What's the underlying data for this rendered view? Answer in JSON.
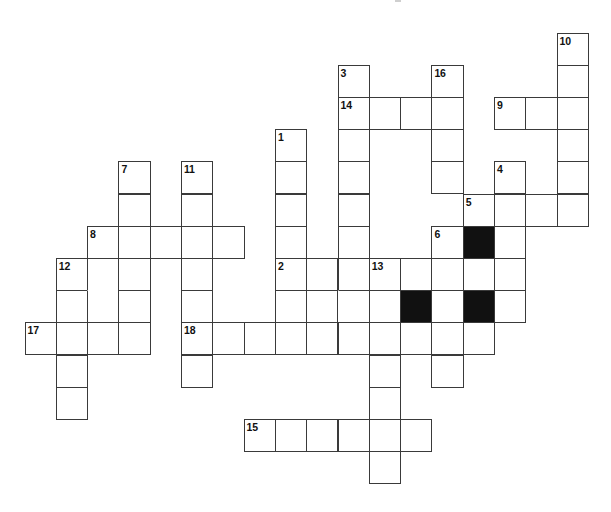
{
  "puzzle": {
    "type": "crossword",
    "grid": {
      "origin_x": 24.5,
      "origin_y": 32.5,
      "cell_width": 31.3,
      "cell_height": 32.2,
      "columns": 18,
      "rows": 14
    },
    "colors": {
      "background": "#ffffff",
      "cell_fill": "#ffffff",
      "block_fill": "#111111",
      "line": "#3a3a3a",
      "number": "#111111"
    },
    "cells": [
      {
        "c": 17,
        "r": 0,
        "num": "10"
      },
      {
        "c": 10,
        "r": 1,
        "num": "3"
      },
      {
        "c": 13,
        "r": 1,
        "num": "16"
      },
      {
        "c": 17,
        "r": 1
      },
      {
        "c": 10,
        "r": 2,
        "num": "14"
      },
      {
        "c": 11,
        "r": 2
      },
      {
        "c": 12,
        "r": 2
      },
      {
        "c": 13,
        "r": 2
      },
      {
        "c": 15,
        "r": 2,
        "num": "9"
      },
      {
        "c": 16,
        "r": 2
      },
      {
        "c": 17,
        "r": 2
      },
      {
        "c": 8,
        "r": 3,
        "num": "1"
      },
      {
        "c": 10,
        "r": 3
      },
      {
        "c": 13,
        "r": 3
      },
      {
        "c": 17,
        "r": 3
      },
      {
        "c": 3,
        "r": 4,
        "num": "7"
      },
      {
        "c": 5,
        "r": 4,
        "num": "11"
      },
      {
        "c": 8,
        "r": 4
      },
      {
        "c": 10,
        "r": 4
      },
      {
        "c": 13,
        "r": 4
      },
      {
        "c": 15,
        "r": 4,
        "num": "4"
      },
      {
        "c": 17,
        "r": 4
      },
      {
        "c": 3,
        "r": 5
      },
      {
        "c": 5,
        "r": 5
      },
      {
        "c": 8,
        "r": 5
      },
      {
        "c": 10,
        "r": 5
      },
      {
        "c": 14,
        "r": 5,
        "num": "5"
      },
      {
        "c": 15,
        "r": 5
      },
      {
        "c": 16,
        "r": 5
      },
      {
        "c": 17,
        "r": 5
      },
      {
        "c": 2,
        "r": 6,
        "num": "8"
      },
      {
        "c": 3,
        "r": 6
      },
      {
        "c": 4,
        "r": 6
      },
      {
        "c": 5,
        "r": 6
      },
      {
        "c": 6,
        "r": 6
      },
      {
        "c": 8,
        "r": 6
      },
      {
        "c": 10,
        "r": 6
      },
      {
        "c": 13,
        "r": 6,
        "num": "6"
      },
      {
        "c": 14,
        "r": 6,
        "black": true
      },
      {
        "c": 15,
        "r": 6
      },
      {
        "c": 1,
        "r": 7,
        "num": "12"
      },
      {
        "c": 2,
        "r": 7
      },
      {
        "c": 3,
        "r": 7
      },
      {
        "c": 5,
        "r": 7
      },
      {
        "c": 8,
        "r": 7,
        "num": "2"
      },
      {
        "c": 9,
        "r": 7
      },
      {
        "c": 10,
        "r": 7
      },
      {
        "c": 11,
        "r": 7,
        "num": "13"
      },
      {
        "c": 12,
        "r": 7
      },
      {
        "c": 13,
        "r": 7
      },
      {
        "c": 14,
        "r": 7
      },
      {
        "c": 15,
        "r": 7
      },
      {
        "c": 1,
        "r": 8
      },
      {
        "c": 2,
        "r": 8,
        "noTop": true
      },
      {
        "c": 3,
        "r": 8
      },
      {
        "c": 5,
        "r": 8
      },
      {
        "c": 8,
        "r": 8
      },
      {
        "c": 9,
        "r": 8
      },
      {
        "c": 10,
        "r": 8,
        "noLeft": true
      },
      {
        "c": 11,
        "r": 8
      },
      {
        "c": 12,
        "r": 8,
        "black": true
      },
      {
        "c": 13,
        "r": 8
      },
      {
        "c": 14,
        "r": 8,
        "black": true
      },
      {
        "c": 15,
        "r": 8
      },
      {
        "c": 0,
        "r": 9,
        "num": "17"
      },
      {
        "c": 1,
        "r": 9
      },
      {
        "c": 2,
        "r": 9
      },
      {
        "c": 3,
        "r": 9
      },
      {
        "c": 5,
        "r": 9,
        "num": "18"
      },
      {
        "c": 6,
        "r": 9
      },
      {
        "c": 7,
        "r": 9
      },
      {
        "c": 8,
        "r": 9
      },
      {
        "c": 9,
        "r": 9
      },
      {
        "c": 10,
        "r": 9
      },
      {
        "c": 11,
        "r": 9
      },
      {
        "c": 12,
        "r": 9
      },
      {
        "c": 13,
        "r": 9
      },
      {
        "c": 14,
        "r": 9
      },
      {
        "c": 1,
        "r": 10
      },
      {
        "c": 5,
        "r": 10
      },
      {
        "c": 11,
        "r": 10
      },
      {
        "c": 13,
        "r": 10
      },
      {
        "c": 1,
        "r": 11
      },
      {
        "c": 11,
        "r": 11
      },
      {
        "c": 7,
        "r": 12,
        "num": "15"
      },
      {
        "c": 8,
        "r": 12
      },
      {
        "c": 9,
        "r": 12
      },
      {
        "c": 10,
        "r": 12
      },
      {
        "c": 11,
        "r": 12
      },
      {
        "c": 12,
        "r": 12
      },
      {
        "c": 11,
        "r": 13
      }
    ],
    "entries": {
      "across": [
        {
          "num": "14",
          "row": 2,
          "col": 10,
          "length": 4
        },
        {
          "num": "9",
          "row": 2,
          "col": 15,
          "length": 3
        },
        {
          "num": "5",
          "row": 5,
          "col": 14,
          "length": 4
        },
        {
          "num": "8",
          "row": 6,
          "col": 2,
          "length": 5
        },
        {
          "num": "2",
          "row": 7,
          "col": 8,
          "length": 8
        },
        {
          "num": "17",
          "row": 9,
          "col": 0,
          "length": 4
        },
        {
          "num": "18",
          "row": 9,
          "col": 5,
          "length": 10
        },
        {
          "num": "15",
          "row": 12,
          "col": 7,
          "length": 6
        }
      ],
      "down": [
        {
          "num": "10",
          "row": 0,
          "col": 17,
          "length": 6
        },
        {
          "num": "3",
          "row": 1,
          "col": 10,
          "length": 9
        },
        {
          "num": "16",
          "row": 1,
          "col": 13,
          "length": 4
        },
        {
          "num": "1",
          "row": 3,
          "col": 8,
          "length": 7
        },
        {
          "num": "7",
          "row": 4,
          "col": 3,
          "length": 6
        },
        {
          "num": "11",
          "row": 4,
          "col": 5,
          "length": 7
        },
        {
          "num": "4",
          "row": 4,
          "col": 15,
          "length": 5
        },
        {
          "num": "8",
          "row": 6,
          "col": 2,
          "length": 4
        },
        {
          "num": "6",
          "row": 6,
          "col": 13,
          "length": 5
        },
        {
          "num": "12",
          "row": 7,
          "col": 1,
          "length": 5
        },
        {
          "num": "13",
          "row": 7,
          "col": 11,
          "length": 7
        }
      ]
    }
  }
}
